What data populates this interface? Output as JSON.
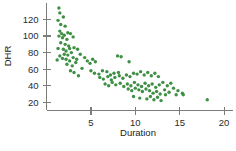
{
  "chart_data": {
    "type": "scatter",
    "title": "",
    "xlabel": "Duration",
    "ylabel": "DHR",
    "xlim": [
      0,
      21
    ],
    "ylim": [
      10,
      140
    ],
    "xticks": [
      5,
      10,
      15,
      20
    ],
    "xtick_labels": [
      "5",
      "10",
      "15",
      "20"
    ],
    "yticks": [
      20,
      40,
      60,
      80,
      100,
      120
    ],
    "ytick_labels": [
      "20",
      "40",
      "60",
      "80",
      "100",
      "120"
    ],
    "grid": false,
    "legend": "none",
    "marker": "circle",
    "marker_color": "#3f8f44",
    "axis_color": "#7c7c78",
    "background_color": "#ffffff",
    "n_points": 120,
    "points": [
      [
        1.4,
        134
      ],
      [
        1.5,
        128
      ],
      [
        1.3,
        119
      ],
      [
        1.9,
        123
      ],
      [
        1.6,
        114
      ],
      [
        1.5,
        106
      ],
      [
        2.1,
        112
      ],
      [
        1.7,
        103
      ],
      [
        2.0,
        101
      ],
      [
        2.4,
        104
      ],
      [
        1.4,
        100
      ],
      [
        1.8,
        98
      ],
      [
        2.3,
        96
      ],
      [
        2.7,
        103
      ],
      [
        3.0,
        99
      ],
      [
        1.6,
        92
      ],
      [
        2.1,
        90
      ],
      [
        2.5,
        88
      ],
      [
        1.3,
        85
      ],
      [
        1.9,
        84
      ],
      [
        2.2,
        82
      ],
      [
        2.6,
        85
      ],
      [
        3.1,
        86
      ],
      [
        3.5,
        84
      ],
      [
        2.0,
        78
      ],
      [
        2.4,
        77
      ],
      [
        2.8,
        80
      ],
      [
        1.5,
        76
      ],
      [
        1.2,
        71
      ],
      [
        1.8,
        73
      ],
      [
        2.2,
        72
      ],
      [
        2.6,
        70
      ],
      [
        3.0,
        74
      ],
      [
        3.4,
        72
      ],
      [
        3.8,
        78
      ],
      [
        4.3,
        74
      ],
      [
        2.3,
        66
      ],
      [
        2.9,
        64
      ],
      [
        3.3,
        68
      ],
      [
        4.6,
        70
      ],
      [
        4.9,
        67
      ],
      [
        5.2,
        72
      ],
      [
        5.5,
        69
      ],
      [
        2.7,
        58
      ],
      [
        3.1,
        56
      ],
      [
        3.6,
        52
      ],
      [
        4.0,
        61
      ],
      [
        5.0,
        58
      ],
      [
        5.4,
        55
      ],
      [
        5.9,
        54
      ],
      [
        6.3,
        58
      ],
      [
        6.8,
        57
      ],
      [
        7.2,
        53
      ],
      [
        7.6,
        55
      ],
      [
        8.1,
        56
      ],
      [
        8.0,
        76
      ],
      [
        8.4,
        75
      ],
      [
        9.3,
        69
      ],
      [
        6.0,
        50
      ],
      [
        6.4,
        48
      ],
      [
        6.9,
        51
      ],
      [
        7.3,
        47
      ],
      [
        7.7,
        50
      ],
      [
        8.2,
        52
      ],
      [
        8.6,
        49
      ],
      [
        9.0,
        53
      ],
      [
        9.4,
        51
      ],
      [
        9.8,
        55
      ],
      [
        10.2,
        54
      ],
      [
        10.6,
        57
      ],
      [
        11.0,
        53
      ],
      [
        11.4,
        56
      ],
      [
        11.8,
        52
      ],
      [
        12.2,
        55
      ],
      [
        12.6,
        51
      ],
      [
        6.6,
        42
      ],
      [
        7.0,
        40
      ],
      [
        7.4,
        44
      ],
      [
        7.8,
        41
      ],
      [
        8.3,
        43
      ],
      [
        8.7,
        39
      ],
      [
        9.1,
        42
      ],
      [
        9.5,
        40
      ],
      [
        9.9,
        44
      ],
      [
        10.3,
        41
      ],
      [
        10.7,
        39
      ],
      [
        11.1,
        43
      ],
      [
        11.5,
        40
      ],
      [
        11.9,
        42
      ],
      [
        12.3,
        38
      ],
      [
        12.7,
        41
      ],
      [
        13.1,
        44
      ],
      [
        13.6,
        40
      ],
      [
        14.0,
        43
      ],
      [
        9.2,
        36
      ],
      [
        9.6,
        34
      ],
      [
        10.0,
        37
      ],
      [
        10.4,
        35
      ],
      [
        10.8,
        33
      ],
      [
        11.2,
        36
      ],
      [
        11.6,
        34
      ],
      [
        12.0,
        31
      ],
      [
        12.4,
        33
      ],
      [
        12.8,
        30
      ],
      [
        13.3,
        35
      ],
      [
        13.8,
        32
      ],
      [
        14.3,
        37
      ],
      [
        14.8,
        34
      ],
      [
        15.3,
        31
      ],
      [
        9.8,
        27
      ],
      [
        10.5,
        25
      ],
      [
        11.3,
        24
      ],
      [
        11.7,
        27
      ],
      [
        12.1,
        23
      ],
      [
        12.5,
        26
      ],
      [
        12.9,
        22
      ],
      [
        13.4,
        29
      ],
      [
        14.6,
        29
      ],
      [
        15.4,
        29
      ],
      [
        18.1,
        23
      ]
    ]
  },
  "axes": {
    "x_axis_name": "duration-axis",
    "y_axis_name": "dhr-axis"
  }
}
